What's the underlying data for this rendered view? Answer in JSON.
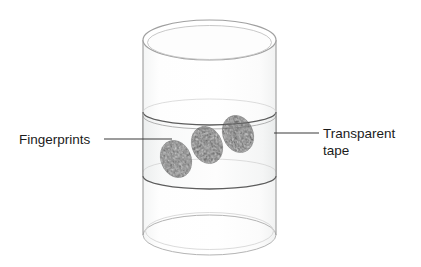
{
  "figure": {
    "background_color": "#ffffff",
    "width": 421,
    "height": 267
  },
  "labels": {
    "left": {
      "text": "Fingerprints",
      "x": 19,
      "y": 144,
      "anchor": "start",
      "leader": {
        "x1": 104,
        "y1": 139,
        "x2": 172,
        "y2": 139
      }
    },
    "right": {
      "line1": "Transparent",
      "line2": "tape",
      "x": 323,
      "y1": 138,
      "y2": 155,
      "anchor": "start",
      "leader": {
        "x1": 274,
        "y1": 133,
        "x2": 319,
        "y2": 133
      }
    }
  },
  "cylinder": {
    "left_x": 143,
    "right_x": 276,
    "top_y": 20,
    "bottom_y": 255,
    "rim_ry": 20,
    "outline_color": "#9a9a9a",
    "fill_color": "#fdfdfd",
    "glass_tint": "#f7f8f8"
  },
  "tape_band": {
    "top_y": 112,
    "bottom_y": 176,
    "band_ry": 13,
    "edge_color": "#6f6f6f",
    "fill_color": "#f2f3f3",
    "description": "transparent tape wrapped around cylinder"
  },
  "fingerprints": [
    {
      "id": "fingerprint-1",
      "cx": 176,
      "cy": 159,
      "rx": 15,
      "ry": 19,
      "rotation": -22
    },
    {
      "id": "fingerprint-2",
      "cx": 207,
      "cy": 145,
      "rx": 15,
      "ry": 19,
      "rotation": -22
    },
    {
      "id": "fingerprint-3",
      "cx": 238,
      "cy": 134,
      "rx": 15,
      "ry": 19,
      "rotation": -22
    },
    {
      "color": "#2b2b2b"
    }
  ],
  "colors": {
    "ink": "#1b1b1b",
    "line": "#4a4a4a",
    "glass_outline": "#9a9a9a",
    "tape_outline": "#6f6f6f",
    "print_dark": "#242424"
  }
}
